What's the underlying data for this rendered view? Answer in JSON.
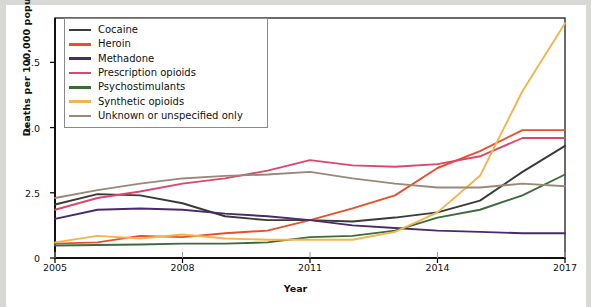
{
  "chart_data": {
    "type": "line",
    "title": "",
    "xlabel": "Year",
    "ylabel": "Deaths per 100,000 population",
    "xlim": [
      2005,
      2017
    ],
    "ylim": [
      0,
      9.2
    ],
    "yticks": [
      0,
      2.5,
      5.0,
      7.5
    ],
    "ytick_labels": [
      "0",
      "2.5",
      "5.0",
      "7.5"
    ],
    "xticks": [
      2005,
      2008,
      2011,
      2014,
      2017
    ],
    "xtick_labels": [
      "2005",
      "2008",
      "2011",
      "2014",
      "2017"
    ],
    "grid": false,
    "legend_position": "upper-left",
    "x": [
      2005,
      2006,
      2007,
      2008,
      2009,
      2010,
      2011,
      2012,
      2013,
      2014,
      2015,
      2016,
      2017
    ],
    "series": [
      {
        "name": "Cocaine",
        "color": "#3a3a36",
        "values": [
          2.05,
          2.45,
          2.4,
          2.1,
          1.6,
          1.45,
          1.45,
          1.4,
          1.55,
          1.75,
          2.2,
          3.3,
          4.3
        ]
      },
      {
        "name": "Heroin",
        "color": "#e8502a",
        "values": [
          0.55,
          0.6,
          0.85,
          0.8,
          0.95,
          1.05,
          1.45,
          1.9,
          2.4,
          3.45,
          4.1,
          4.9,
          4.9
        ]
      },
      {
        "name": "Methadone",
        "color": "#4b2a6b",
        "values": [
          1.5,
          1.85,
          1.9,
          1.85,
          1.7,
          1.6,
          1.45,
          1.25,
          1.15,
          1.05,
          1.0,
          0.95,
          0.95
        ]
      },
      {
        "name": "Prescription opioids",
        "color": "#e0456b",
        "values": [
          1.85,
          2.3,
          2.55,
          2.85,
          3.05,
          3.35,
          3.75,
          3.55,
          3.5,
          3.6,
          3.9,
          4.6,
          4.6
        ]
      },
      {
        "name": "Psychostimulants",
        "color": "#3d6b3a",
        "values": [
          0.48,
          0.5,
          0.52,
          0.55,
          0.55,
          0.6,
          0.8,
          0.85,
          1.05,
          1.55,
          1.85,
          2.4,
          3.2
        ]
      },
      {
        "name": "Synthetic opioids",
        "color": "#f2b44c",
        "values": [
          0.6,
          0.85,
          0.75,
          0.9,
          0.75,
          0.7,
          0.7,
          0.7,
          1.0,
          1.75,
          3.15,
          6.4,
          9.0
        ]
      },
      {
        "name": "Unknown or unspecified only",
        "color": "#9b8878",
        "values": [
          2.3,
          2.6,
          2.85,
          3.05,
          3.15,
          3.2,
          3.3,
          3.05,
          2.85,
          2.7,
          2.7,
          2.85,
          2.75
        ]
      }
    ]
  },
  "legend": {
    "items": [
      {
        "label": "Cocaine"
      },
      {
        "label": "Heroin"
      },
      {
        "label": "Methadone"
      },
      {
        "label": "Prescription opioids"
      },
      {
        "label": "Psychostimulants"
      },
      {
        "label": "Synthetic opioids"
      },
      {
        "label": "Unknown or unspecified only"
      }
    ]
  }
}
